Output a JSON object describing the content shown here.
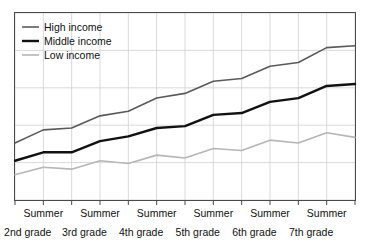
{
  "chart_data": {
    "type": "line",
    "title": "",
    "subtitle": "",
    "xlabel": "",
    "ylabel": "",
    "grid": true,
    "legend_position": "top-left",
    "xlim": [
      0,
      12
    ],
    "ylim": [
      0,
      100
    ],
    "x": [
      0,
      1,
      2,
      3,
      4,
      5,
      6,
      7,
      8,
      9,
      10,
      11,
      12
    ],
    "categories": [
      "2nd grade",
      "Summer",
      "3rd grade",
      "Summer",
      "4th grade",
      "Summer",
      "5th grade",
      "Summer",
      "6th grade",
      "Summer",
      "7th grade",
      "Summer",
      ""
    ],
    "xtick_labels_summer": [
      "Summer",
      "Summer",
      "Summer",
      "Summer",
      "Summer",
      "Summer"
    ],
    "xtick_labels_grade": [
      "2nd grade",
      "3rd grade",
      "4th grade",
      "5th grade",
      "6th grade",
      "7th grade"
    ],
    "series": [
      {
        "name": "High income",
        "color": "#5a5a5a",
        "width": 1.6,
        "values": [
          30.5,
          37.5,
          38.5,
          45.0,
          47.5,
          54.5,
          57.0,
          63.5,
          65.0,
          71.5,
          73.5,
          81.5,
          82.5
        ]
      },
      {
        "name": "Middle income",
        "color": "#111111",
        "width": 2.4,
        "values": [
          21.0,
          25.5,
          25.5,
          31.5,
          34.0,
          38.5,
          39.5,
          45.5,
          46.5,
          52.5,
          54.5,
          61.0,
          62.0
        ]
      },
      {
        "name": "Low income",
        "color": "#b6b6b6",
        "width": 1.6,
        "values": [
          13.5,
          17.5,
          16.5,
          21.0,
          19.5,
          24.0,
          22.5,
          27.5,
          26.5,
          32.0,
          30.5,
          36.0,
          33.5
        ]
      }
    ]
  },
  "legend": {
    "items": [
      {
        "label": "High income",
        "color": "#5a5a5a"
      },
      {
        "label": "Middle income",
        "color": "#111111"
      },
      {
        "label": "Low income",
        "color": "#b6b6b6"
      }
    ]
  },
  "axis": {
    "summer_labels": [
      "Summer",
      "Summer",
      "Summer",
      "Summer",
      "Summer",
      "Summer"
    ],
    "grade_labels": [
      "2nd grade",
      "3rd grade",
      "4th grade",
      "5th grade",
      "6th grade",
      "7th grade"
    ]
  },
  "style": {
    "plot_border_color": "#4a4a4a",
    "grid_color": "#cfcfcf",
    "background": "#ffffff",
    "text_color": "#111111"
  }
}
